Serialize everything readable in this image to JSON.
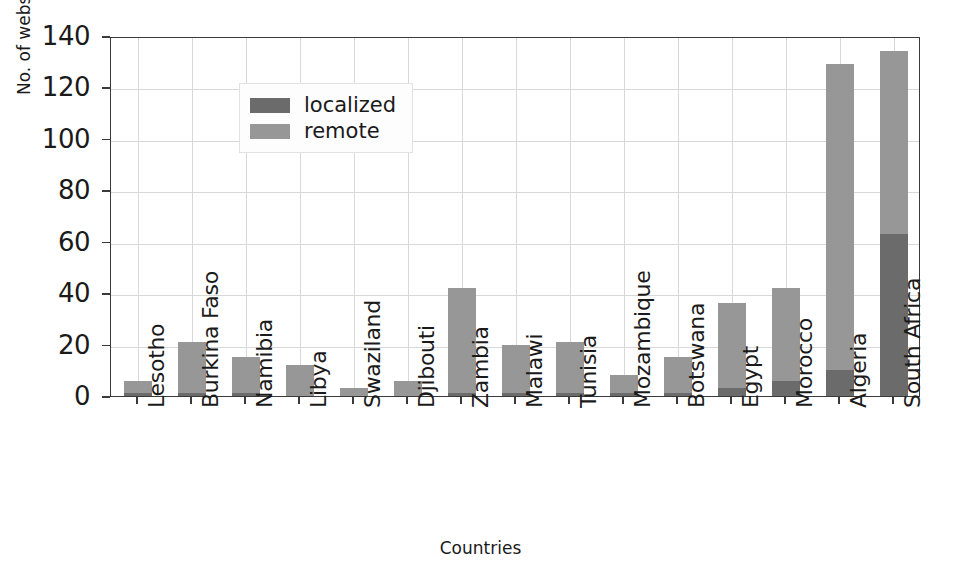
{
  "chart_data": {
    "type": "bar",
    "subtype": "stacked-vertical-bar",
    "title": "",
    "xlabel": "Countries",
    "ylabel": "No. of websites",
    "ylim": [
      0,
      140
    ],
    "ytick_values": [
      0,
      20,
      40,
      60,
      80,
      100,
      120,
      140
    ],
    "ytick_labels": [
      "0",
      "20",
      "40",
      "60",
      "80",
      "100",
      "120",
      "140"
    ],
    "grid": true,
    "legend_position": "upper left",
    "categories": [
      "Lesotho",
      "Burkina Faso",
      "Namibia",
      "Libya",
      "Swaziland",
      "Djibouti",
      "Zambia",
      "Malawi",
      "Tunisia",
      "Mozambique",
      "Botswana",
      "Egypt",
      "Morocco",
      "Algeria",
      "South Africa"
    ],
    "series": [
      {
        "name": "localized",
        "color": "#6b6b6b",
        "values": [
          1,
          1,
          1,
          0,
          0,
          0,
          1,
          1,
          1,
          1,
          1,
          3,
          6,
          10,
          63
        ]
      },
      {
        "name": "remote",
        "color": "#979797",
        "values": [
          5,
          20,
          14,
          12,
          3,
          6,
          41,
          19,
          20,
          7,
          14,
          33,
          36,
          119,
          71
        ]
      }
    ],
    "totals": [
      6,
      21,
      15,
      12,
      3,
      6,
      42,
      20,
      21,
      8,
      15,
      36,
      42,
      129,
      134
    ]
  },
  "legend": {
    "items": [
      {
        "label": "localized",
        "color": "#6b6b6b"
      },
      {
        "label": "remote",
        "color": "#979797"
      }
    ]
  },
  "axes": {
    "x_title": "Countries",
    "y_title": "No. of websites"
  }
}
